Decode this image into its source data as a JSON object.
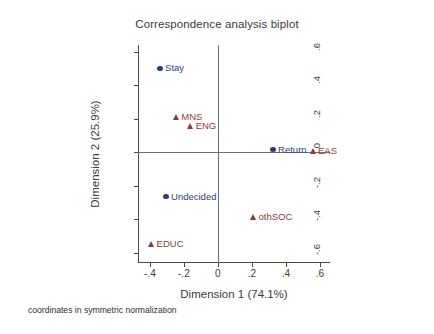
{
  "chart_data": {
    "type": "scatter",
    "title": "Correspondence analysis biplot",
    "xlabel": "Dimension 1 (74.1%)",
    "ylabel": "Dimension 2 (25.9%)",
    "footnote": "coordinates in symmetric normalization",
    "xlim": [
      -0.47,
      0.66
    ],
    "ylim": [
      -0.66,
      0.64
    ],
    "xticks": [
      "-.4",
      "-.2",
      "0",
      ".2",
      ".4",
      ".6"
    ],
    "xtickvals": [
      -0.4,
      -0.2,
      0,
      0.2,
      0.4,
      0.6
    ],
    "yticks": [
      ".6",
      ".4",
      ".2",
      "0",
      "-.2",
      "-.4",
      "-.6"
    ],
    "ytickvals": [
      0.6,
      0.4,
      0.2,
      0,
      -0.2,
      -0.4,
      -0.6
    ],
    "grid": false,
    "legend": "none",
    "zero_reference_lines": true,
    "series": [
      {
        "name": "row categories",
        "marker": "circle",
        "color": "#2c3f7a",
        "points": [
          {
            "label": "Stay",
            "x": -0.34,
            "y": 0.5
          },
          {
            "label": "Return",
            "x": 0.325,
            "y": 0.015
          },
          {
            "label": "Undecided",
            "x": -0.305,
            "y": -0.265
          }
        ]
      },
      {
        "name": "column categories",
        "marker": "triangle",
        "color": "#8d3a3a",
        "points": [
          {
            "label": "MNS",
            "x": -0.245,
            "y": 0.21
          },
          {
            "label": "ENG",
            "x": -0.16,
            "y": 0.155
          },
          {
            "label": "EAS",
            "x": 0.56,
            "y": 0.005
          },
          {
            "label": "othSOC",
            "x": 0.21,
            "y": -0.385
          },
          {
            "label": "EDUC",
            "x": -0.39,
            "y": -0.545
          }
        ]
      }
    ]
  }
}
